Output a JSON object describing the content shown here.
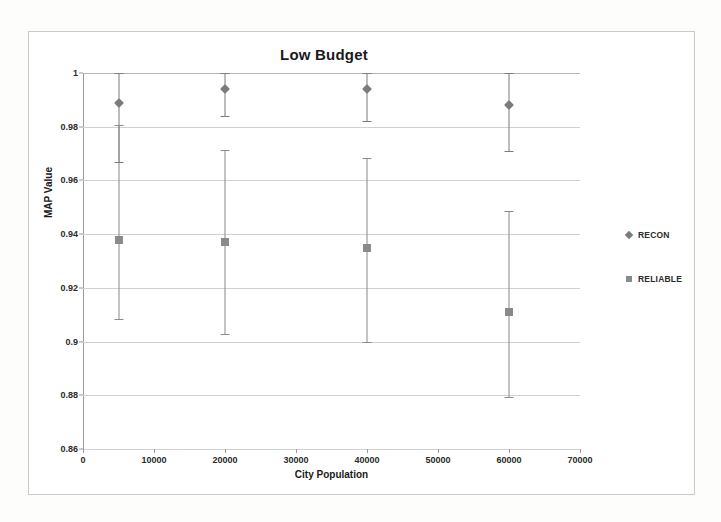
{
  "chart_data": {
    "type": "scatter",
    "title": "Low Budget",
    "xlabel": "City Population",
    "ylabel": "MAP Value",
    "xlim": [
      0,
      70000
    ],
    "ylim": [
      0.86,
      1
    ],
    "xticks": [
      0,
      10000,
      20000,
      30000,
      40000,
      50000,
      60000,
      70000
    ],
    "xtick_labels": [
      "0",
      "10000",
      "20000",
      "30000",
      "40000",
      "50000",
      "60000",
      "70000"
    ],
    "yticks": [
      0.86,
      0.88,
      0.9,
      0.92,
      0.94,
      0.96,
      0.98,
      1
    ],
    "ytick_labels": [
      "0.86",
      "0.88",
      "0.9",
      "0.92",
      "0.94",
      "0.96",
      "0.98",
      "1"
    ],
    "grid": true,
    "legend_position": "right",
    "x": [
      5000,
      20000,
      40000,
      60000
    ],
    "series": [
      {
        "name": "RECON",
        "marker": "diamond",
        "color": "#7b7b7b",
        "values": [
          0.989,
          0.994,
          0.994,
          0.988
        ],
        "err_low": [
          0.967,
          0.984,
          0.982,
          0.971
        ],
        "err_high": [
          1.0,
          1.0,
          1.0,
          1.0
        ]
      },
      {
        "name": "RELIABLE",
        "marker": "square",
        "color": "#8a8a8a",
        "values": [
          0.938,
          0.937,
          0.935,
          0.911
        ],
        "err_low": [
          0.9085,
          0.903,
          0.9,
          0.8792
        ],
        "err_high": [
          0.9805,
          0.9715,
          0.9685,
          0.9485
        ]
      }
    ]
  },
  "legend": {
    "items": [
      {
        "label": "RECON"
      },
      {
        "label": "RELIABLE"
      }
    ]
  }
}
